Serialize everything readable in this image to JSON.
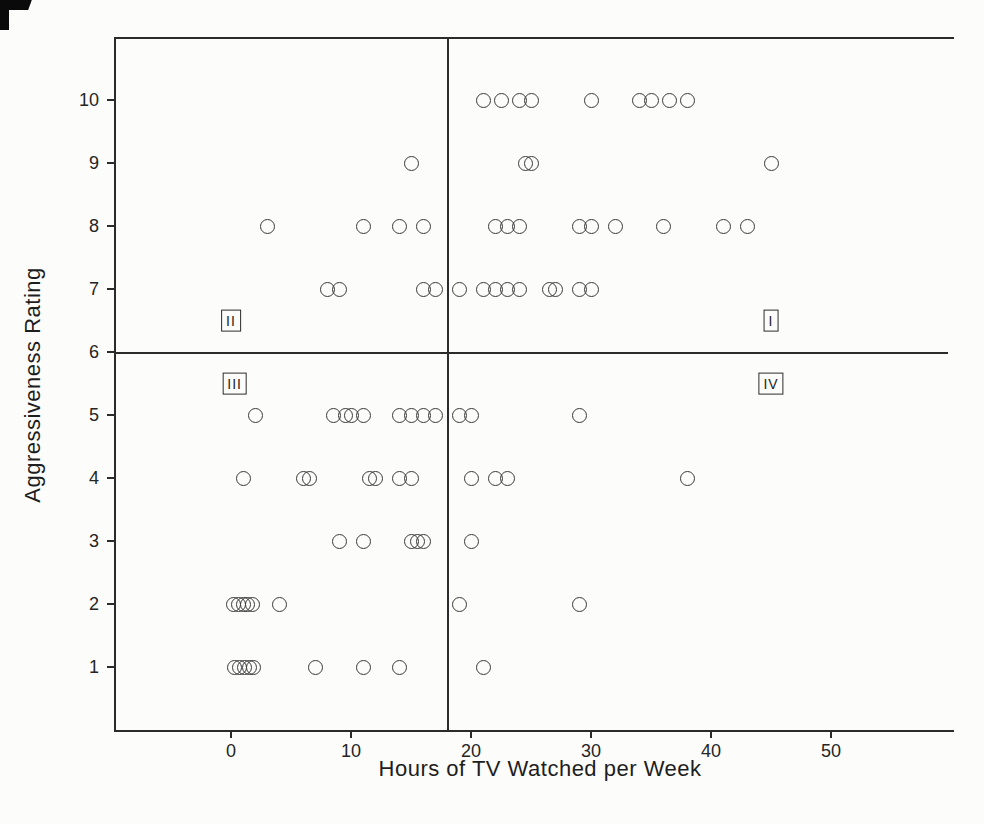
{
  "figure": {
    "xlabel": "Hours of TV Watched per Week",
    "ylabel": "Aggressiveness Rating"
  },
  "chart_data": {
    "type": "scatter",
    "title": "",
    "xlabel": "Hours of TV Watched per Week",
    "ylabel": "Aggressiveness Rating",
    "x_ticks": [
      0,
      10,
      20,
      30,
      40,
      50
    ],
    "y_ticks": [
      1,
      2,
      3,
      4,
      5,
      6,
      7,
      8,
      9,
      10
    ],
    "xlim": [
      -9.5,
      60
    ],
    "ylim": [
      0,
      11
    ],
    "grid": false,
    "legend": "none",
    "marker": "open-circle",
    "quadrant_divider": {
      "x": 18,
      "y": 6
    },
    "quadrant_labels": [
      {
        "label": "I",
        "x": 45,
        "y": 6.5
      },
      {
        "label": "II",
        "x": 0,
        "y": 6.5
      },
      {
        "label": "III",
        "x": 0.3,
        "y": 5.5
      },
      {
        "label": "IV",
        "x": 45,
        "y": 5.5
      }
    ],
    "points": [
      [
        21,
        10
      ],
      [
        22.5,
        10
      ],
      [
        24,
        10
      ],
      [
        25,
        10
      ],
      [
        30,
        10
      ],
      [
        34,
        10
      ],
      [
        35,
        10
      ],
      [
        36.5,
        10
      ],
      [
        38,
        10
      ],
      [
        15,
        9
      ],
      [
        24.5,
        9
      ],
      [
        25,
        9
      ],
      [
        45,
        9
      ],
      [
        3,
        8
      ],
      [
        11,
        8
      ],
      [
        14,
        8
      ],
      [
        16,
        8
      ],
      [
        22,
        8
      ],
      [
        23,
        8
      ],
      [
        24,
        8
      ],
      [
        29,
        8
      ],
      [
        30,
        8
      ],
      [
        32,
        8
      ],
      [
        36,
        8
      ],
      [
        41,
        8
      ],
      [
        43,
        8
      ],
      [
        8,
        7
      ],
      [
        9,
        7
      ],
      [
        16,
        7
      ],
      [
        17,
        7
      ],
      [
        19,
        7
      ],
      [
        21,
        7
      ],
      [
        22,
        7
      ],
      [
        23,
        7
      ],
      [
        24,
        7
      ],
      [
        26.5,
        7
      ],
      [
        27,
        7
      ],
      [
        29,
        7
      ],
      [
        30,
        7
      ],
      [
        2,
        5
      ],
      [
        8.5,
        5
      ],
      [
        9.5,
        5
      ],
      [
        10,
        5
      ],
      [
        11,
        5
      ],
      [
        14,
        5
      ],
      [
        15,
        5
      ],
      [
        16,
        5
      ],
      [
        17,
        5
      ],
      [
        19,
        5
      ],
      [
        20,
        5
      ],
      [
        29,
        5
      ],
      [
        1,
        4
      ],
      [
        6,
        4
      ],
      [
        6.5,
        4
      ],
      [
        11.5,
        4
      ],
      [
        12,
        4
      ],
      [
        14,
        4
      ],
      [
        15,
        4
      ],
      [
        20,
        4
      ],
      [
        22,
        4
      ],
      [
        23,
        4
      ],
      [
        38,
        4
      ],
      [
        9,
        3
      ],
      [
        11,
        3
      ],
      [
        15,
        3
      ],
      [
        15.5,
        3
      ],
      [
        16,
        3
      ],
      [
        20,
        3
      ],
      [
        0.2,
        2
      ],
      [
        0.6,
        2
      ],
      [
        1,
        2
      ],
      [
        1.4,
        2
      ],
      [
        1.8,
        2
      ],
      [
        4,
        2
      ],
      [
        19,
        2
      ],
      [
        29,
        2
      ],
      [
        0.3,
        1
      ],
      [
        0.7,
        1
      ],
      [
        1.1,
        1
      ],
      [
        1.5,
        1
      ],
      [
        1.9,
        1
      ],
      [
        7,
        1
      ],
      [
        11,
        1
      ],
      [
        14,
        1
      ],
      [
        21,
        1
      ]
    ]
  }
}
